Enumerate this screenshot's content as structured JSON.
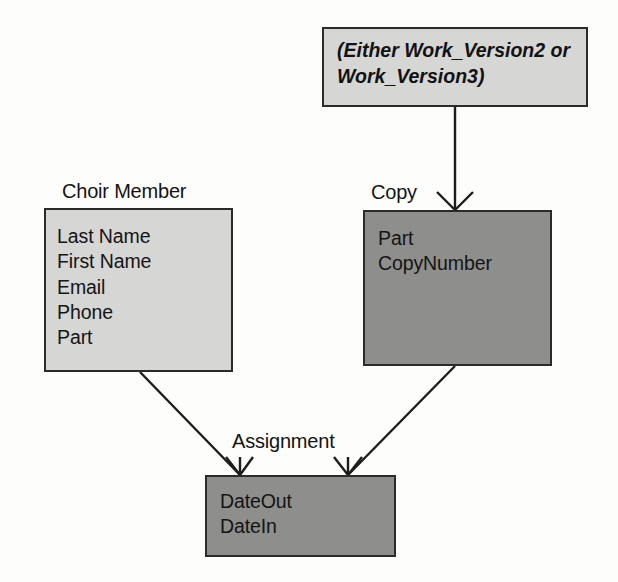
{
  "diagram": {
    "title_note": {
      "name": "work-version-note",
      "line1": "(Either Work_Version2 or",
      "line2": "Work_Version3)",
      "fill": "#d6d6d4",
      "stroke": "#2b2b2b"
    },
    "entities": [
      {
        "id": "choir-member",
        "label": "Choir Member",
        "fill": "#d6d6d4",
        "attributes": [
          "Last Name",
          "First Name",
          "Email",
          "Phone",
          "Part"
        ]
      },
      {
        "id": "copy",
        "label": "Copy",
        "fill": "#8e8e8c",
        "attributes": [
          "Part",
          "CopyNumber"
        ]
      },
      {
        "id": "assignment",
        "label": "Assignment",
        "fill": "#8e8e8c",
        "attributes": [
          "DateOut",
          "DateIn"
        ]
      }
    ],
    "relationships": [
      {
        "id": "workversion-to-copy",
        "from": "work-version-note",
        "to": "copy",
        "to_cardinality": "many",
        "from_cardinality": "one"
      },
      {
        "id": "choirmember-to-assignment",
        "from": "choir-member",
        "to": "assignment",
        "to_cardinality": "many",
        "from_cardinality": "one"
      },
      {
        "id": "copy-to-assignment",
        "from": "copy",
        "to": "assignment",
        "to_cardinality": "many",
        "from_cardinality": "one"
      }
    ],
    "line_color": "#1d1d1d"
  }
}
